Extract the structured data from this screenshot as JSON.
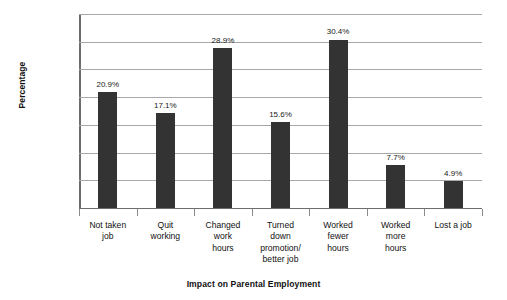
{
  "chart_data": {
    "type": "bar",
    "title": "",
    "xlabel": "Impact on Parental Employment",
    "ylabel": "Percentage",
    "categories": [
      "Not taken job",
      "Quit working",
      "Changed work hours",
      "Turned down promotion/ better job",
      "Worked fewer hours",
      "Worked more hours",
      "Lost a job"
    ],
    "category_lines": [
      [
        "Not taken",
        "job"
      ],
      [
        "Quit",
        "working"
      ],
      [
        "Changed",
        "work",
        "hours"
      ],
      [
        "Turned",
        "down",
        "promotion/",
        "better job"
      ],
      [
        "Worked",
        "fewer",
        "hours"
      ],
      [
        "Worked",
        "more",
        "hours"
      ],
      [
        "Lost a job"
      ]
    ],
    "values": [
      0.209,
      0.171,
      0.289,
      0.156,
      0.304,
      0.077,
      0.049
    ],
    "data_labels": [
      "20.9%",
      "17.1%",
      "28.9%",
      "15.6%",
      "30.4%",
      "7.7%",
      "4.9%"
    ],
    "ylim": [
      0,
      0.35
    ],
    "ytick_values": [
      0,
      0.05,
      0.1,
      0.15,
      0.2,
      0.25,
      0.3,
      0.35
    ],
    "ytick_labels": [
      "0",
      "0.05",
      "0.1",
      "0.15",
      "0.2",
      "0.25",
      "0.3",
      "0.35"
    ],
    "grid": "horizontal",
    "legend": "none",
    "bar_color": "#333333",
    "grid_color": "#a8a8a8",
    "axis_color": "#6d6d6d",
    "background": "#ffffff"
  }
}
